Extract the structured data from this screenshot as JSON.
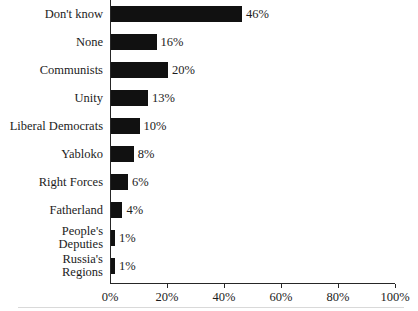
{
  "chart_data": {
    "type": "bar",
    "orientation": "horizontal",
    "title": "",
    "subtitle": "",
    "xlabel": "",
    "ylabel": "",
    "categories": [
      "Don't know",
      "None",
      "Communists",
      "Unity",
      "Liberal Democrats",
      "Yabloko",
      "Right Forces",
      "Fatherland",
      "People's\nDeputies",
      "Russia's\nRegions"
    ],
    "values": [
      46,
      16,
      20,
      13,
      10,
      8,
      6,
      4,
      1,
      1
    ],
    "value_labels": [
      "46%",
      "16%",
      "20%",
      "13%",
      "10%",
      "8%",
      "6%",
      "4%",
      "1%",
      "1%"
    ],
    "xlim": [
      0,
      100
    ],
    "xticks": [
      0,
      20,
      40,
      60,
      80,
      100
    ],
    "xtick_labels": [
      "0%",
      "20%",
      "40%",
      "60%",
      "80%",
      "100%"
    ],
    "grid": false,
    "legend": false,
    "bar_color": "#111111",
    "axis_color": "#262626",
    "text_color": "#1c1c1c",
    "background_color": "#ffffff"
  }
}
